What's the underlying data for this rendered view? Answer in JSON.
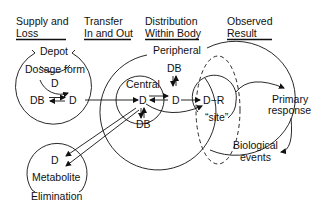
{
  "headers": [
    {
      "line1": "Supply and",
      "line2": "Loss"
    },
    {
      "line1": "Transfer",
      "line2": "In and Out"
    },
    {
      "line1": "Distribution",
      "line2": "Within Body"
    },
    {
      "line1": "Observed",
      "line2": "Result"
    }
  ],
  "depot": {
    "title": "Depot",
    "dosage_form": "Dosage form",
    "d_inner": "D",
    "db": "DB",
    "d": "D"
  },
  "body": {
    "peripheral": "Peripheral",
    "central": "Central",
    "d_central": "D",
    "db_central": "DB",
    "d_peripheral": "D",
    "db_peripheral": "DB"
  },
  "site": {
    "complex": "D−R",
    "label": "“site”"
  },
  "result": {
    "primary_line1": "Primary",
    "primary_line2": "response",
    "bio_line1": "Biological",
    "bio_line2": "events"
  },
  "elimination": {
    "d": "D",
    "metabolite": "Metabolite",
    "title": "Elimination"
  }
}
